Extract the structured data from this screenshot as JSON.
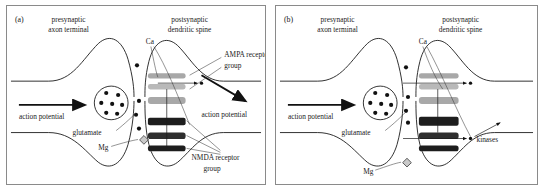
{
  "figure": {
    "panels": [
      {
        "id": "a",
        "tag": "(a)",
        "labels": {
          "presynaptic": "presynaptic",
          "presynaptic2": "axon terminal",
          "postsynaptic": "postsynaptic",
          "postsynaptic2": "dendritic spine",
          "calcium": "Ca",
          "ampa": "AMPA receptor",
          "ampa2": "group",
          "nmda": "NMDA receptor",
          "nmda2": "group",
          "action_potential_in": "action potential",
          "action_potential_out": "action potential",
          "glutamate": "glutamate",
          "magnesium": "Mg"
        }
      },
      {
        "id": "b",
        "tag": "(b)",
        "labels": {
          "presynaptic": "presynaptic",
          "presynaptic2": "axon terminal",
          "postsynaptic": "postsynaptic",
          "postsynaptic2": "dendritic spine",
          "calcium": "Ca",
          "action_potential_in": "action potential",
          "glutamate": "glutamate",
          "magnesium": "Mg",
          "kinases": "kinases"
        }
      }
    ],
    "colors": {
      "ampa_receptor": "#a8a8a8",
      "nmda_receptor": "#1d1d1d",
      "membrane_line": "#1a1a1a",
      "leader_line": "#3b3b3b",
      "magnesium_ion": "#c9c9c9",
      "panel_border": "#8a8a8a",
      "background": "#ffffff"
    },
    "counts": {
      "vesicle_glutamate_dots": 7,
      "ampa_bars": 3,
      "nmda_bars": 3
    }
  }
}
